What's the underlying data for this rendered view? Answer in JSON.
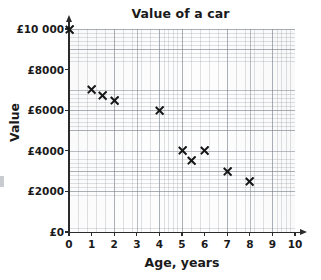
{
  "chart_data": {
    "type": "scatter",
    "title": "Value of a car",
    "xlabel": "Age, years",
    "ylabel": "Value",
    "xlim": [
      0,
      10
    ],
    "ylim": [
      0,
      10000
    ],
    "grid": true,
    "legend": null,
    "x_ticks": [
      "0",
      "1",
      "2",
      "3",
      "4",
      "5",
      "6",
      "7",
      "8",
      "9",
      "10"
    ],
    "x_tick_values": [
      0,
      1,
      2,
      3,
      4,
      5,
      6,
      7,
      8,
      9,
      10
    ],
    "y_ticks": [
      "£0",
      "£2000",
      "£4000",
      "£6000",
      "£8000",
      "£10 000"
    ],
    "y_tick_values": [
      0,
      2000,
      4000,
      6000,
      8000,
      10000
    ],
    "marker": "x",
    "marker_color": "#161616",
    "points": [
      {
        "x": 0,
        "y": 10000
      },
      {
        "x": 1,
        "y": 7000
      },
      {
        "x": 1.5,
        "y": 6700
      },
      {
        "x": 2,
        "y": 6500
      },
      {
        "x": 4,
        "y": 6000
      },
      {
        "x": 5,
        "y": 4000
      },
      {
        "x": 5.4,
        "y": 3500
      },
      {
        "x": 6,
        "y": 4000
      },
      {
        "x": 7,
        "y": 3000
      },
      {
        "x": 8,
        "y": 2500
      }
    ]
  },
  "colors": {
    "axis": "#2b2b2b",
    "marker": "#161616",
    "grid_major": "#78808a",
    "grid_minor": "#8c949e",
    "paper": "#fdfdfd"
  }
}
